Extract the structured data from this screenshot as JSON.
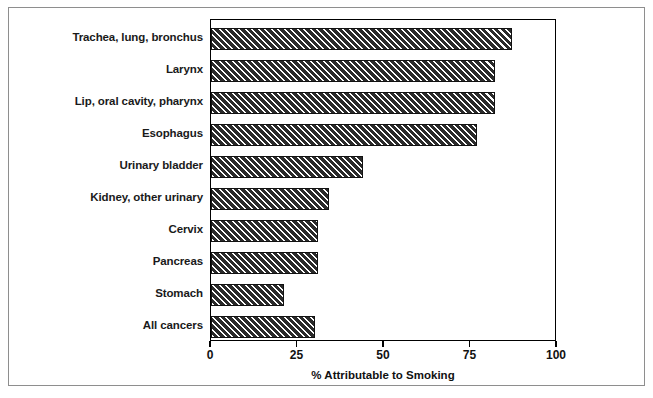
{
  "chart_data": {
    "type": "bar",
    "orientation": "horizontal",
    "title": "",
    "xlabel": "% Attributable to Smoking",
    "ylabel": "",
    "categories": [
      "Trachea, lung, bronchus",
      "Larynx",
      "Lip, oral cavity, pharynx",
      "Esophagus",
      "Urinary bladder",
      "Kidney, other urinary",
      "Cervix",
      "Pancreas",
      "Stomach",
      "All cancers"
    ],
    "values": [
      87,
      82,
      82,
      77,
      44,
      34,
      31,
      31,
      21,
      30
    ],
    "xlim": [
      0,
      100
    ],
    "xticks": [
      0,
      25,
      50,
      75,
      100
    ],
    "xtick_labels": [
      "0",
      "25",
      "50",
      "75",
      "100"
    ],
    "grid": false,
    "legend": false,
    "bar_fill": "diagonal-hatch",
    "bar_color": "#2b2b2b",
    "frame_color": "#000000",
    "background_color": "#ffffff"
  },
  "figure": {
    "outer_border_color": "#8e8e8e"
  }
}
